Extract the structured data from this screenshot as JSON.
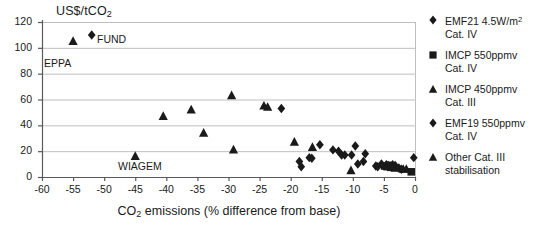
{
  "axes": {
    "y_title": "US$/tCO",
    "y_title_sub": "2",
    "x_title_pre": "CO",
    "x_title_sub": "2",
    "x_title_post": " emissions (% difference from base)",
    "ytick_labels": [
      "0",
      "20",
      "40",
      "60",
      "80",
      "100",
      "120"
    ],
    "xtick_labels": [
      "-60",
      "-55",
      "-50",
      "-45",
      "-40",
      "-35",
      "-30",
      "-25",
      "-20",
      "-15",
      "-10",
      "-5",
      "0"
    ]
  },
  "annotations": [
    {
      "label": "FUND",
      "x": 97,
      "y": 33
    },
    {
      "label": "EPPA",
      "x": 44,
      "y": 57
    },
    {
      "label": "WIAGEM",
      "x": 118,
      "y": 160
    }
  ],
  "legend": {
    "entries": [
      {
        "marker": "diamond",
        "line1": "EMF21 4.5W/m",
        "sup": "2",
        "line2": "Cat. IV"
      },
      {
        "marker": "square",
        "line1": "IMCP 550ppmv",
        "sup": "",
        "line2": "Cat. IV"
      },
      {
        "marker": "triangle",
        "line1": "IMCP 450ppmv",
        "sup": "",
        "line2": "Cat. III"
      },
      {
        "marker": "diamond",
        "line1": "EMF19 550ppmv",
        "sup": "",
        "line2": "Cat. IV"
      },
      {
        "marker": "triangle",
        "line1": "Other Cat. III",
        "sup": "",
        "line2": "stabilisation"
      }
    ]
  },
  "colors": {
    "marker": "#1a1a1a",
    "axis": "#595959",
    "grid": "#bfbfbf",
    "background": "#ffffff"
  },
  "chart_data": {
    "type": "scatter",
    "title": "",
    "xlabel": "CO2 emissions (% difference from base)",
    "ylabel": "US$/tCO2",
    "xlim": [
      -60,
      0
    ],
    "ylim": [
      0,
      120
    ],
    "xticks": [
      -60,
      -55,
      -50,
      -45,
      -40,
      -35,
      -30,
      -25,
      -20,
      -15,
      -10,
      -5,
      0
    ],
    "yticks": [
      0,
      20,
      40,
      60,
      80,
      100,
      120
    ],
    "grid": "horizontal",
    "legend_position": "right",
    "series": [
      {
        "name": "EMF21 4.5W/m2 Cat. IV",
        "marker": "diamond",
        "points": [
          [
            -52.0,
            110.0
          ],
          [
            -21.5,
            53.0
          ],
          [
            -15.3,
            25.0
          ],
          [
            -13.2,
            21.0
          ],
          [
            -12.3,
            20.0
          ],
          [
            -11.8,
            17.0
          ],
          [
            -11.3,
            17.0
          ],
          [
            -10.2,
            17.0
          ],
          [
            -9.6,
            24.0
          ],
          [
            -8.0,
            18.0
          ],
          [
            -18.6,
            12.0
          ],
          [
            -18.3,
            8.0
          ],
          [
            -17.0,
            15.0
          ],
          [
            -16.6,
            14.5
          ],
          [
            -9.2,
            10.0
          ],
          [
            -8.3,
            12.0
          ],
          [
            -6.3,
            8.5
          ],
          [
            -6.0,
            8.0
          ],
          [
            -5.4,
            10.0
          ],
          [
            -4.6,
            9.5
          ],
          [
            -4.3,
            9.0
          ],
          [
            -3.6,
            9.5
          ],
          [
            -3.2,
            9.0
          ],
          [
            -2.6,
            7.0
          ],
          [
            -2.2,
            6.0
          ],
          [
            -0.2,
            15.0
          ]
        ]
      },
      {
        "name": "IMCP 550ppmv Cat. IV",
        "marker": "square",
        "points": [
          [
            -4.9,
            8.5
          ],
          [
            -4.5,
            8.0
          ],
          [
            -4.2,
            9.0
          ],
          [
            -3.9,
            7.5
          ],
          [
            -3.6,
            8.5
          ],
          [
            -3.3,
            7.0
          ],
          [
            -0.6,
            4.0
          ]
        ]
      },
      {
        "name": "IMCP 450ppmv Cat. III",
        "marker": "triangle",
        "points": [
          [
            -55.0,
            105.0
          ],
          [
            -24.3,
            55.0
          ],
          [
            -23.7,
            54.0
          ],
          [
            -19.4,
            27.0
          ],
          [
            -16.5,
            23.0
          ],
          [
            -10.3,
            5.0
          ],
          [
            -1.9,
            6.0
          ],
          [
            -1.4,
            6.0
          ]
        ]
      },
      {
        "name": "EMF19 550ppmv Cat. IV",
        "marker": "diamond",
        "points": []
      },
      {
        "name": "Other Cat. III stabilisation",
        "marker": "triangle",
        "points": [
          [
            -45.0,
            16.0
          ],
          [
            -40.5,
            47.0
          ],
          [
            -36.0,
            52.0
          ],
          [
            -34.0,
            34.0
          ],
          [
            -29.5,
            63.0
          ],
          [
            -29.2,
            21.0
          ]
        ]
      }
    ]
  }
}
